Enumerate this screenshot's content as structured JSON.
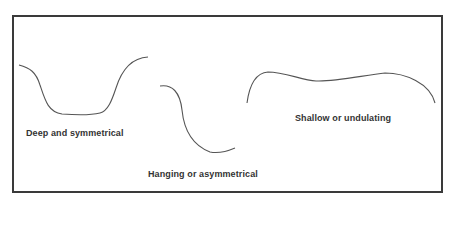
{
  "diagram": {
    "type": "valley cross-section profiles",
    "colors": {
      "line": "#555555",
      "border": "#3a3a3a",
      "text": "#333333"
    },
    "profiles": [
      {
        "id": "deep",
        "label": "Deep and symmetrical"
      },
      {
        "id": "hanging",
        "label": "Hanging or asymmetrical"
      },
      {
        "id": "shallow",
        "label": "Shallow or undulating"
      }
    ]
  }
}
